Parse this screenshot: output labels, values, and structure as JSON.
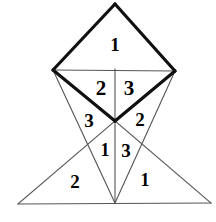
{
  "figure": {
    "canvas": {
      "width": 216,
      "height": 222
    },
    "colors": {
      "background": "#ffffff",
      "stroke_heavy": "#101010",
      "stroke_light": "#555555",
      "label": "#000000"
    },
    "stroke_widths": {
      "heavy": 3.2,
      "light": 1.1
    },
    "vertices": {
      "top_apex": {
        "x": 115,
        "y": 4
      },
      "left_vertex": {
        "x": 53,
        "y": 70
      },
      "right_vertex": {
        "x": 175,
        "y": 71
      },
      "center": {
        "x": 115,
        "y": 121
      },
      "bottom_apex": {
        "x": 115,
        "y": 203
      },
      "bottom_left": {
        "x": 18,
        "y": 204
      },
      "bottom_right": {
        "x": 211,
        "y": 203
      }
    },
    "edges": [
      {
        "name": "diamond-upper-left",
        "from": "top_apex",
        "to": "left_vertex",
        "weight": "heavy"
      },
      {
        "name": "diamond-upper-right",
        "from": "top_apex",
        "to": "right_vertex",
        "weight": "heavy"
      },
      {
        "name": "diamond-lower-left",
        "from": "left_vertex",
        "to": "center",
        "weight": "heavy"
      },
      {
        "name": "diamond-lower-right",
        "from": "right_vertex",
        "to": "center",
        "weight": "heavy"
      },
      {
        "name": "diamond-horizontal-diagonal",
        "from": "left_vertex",
        "to": "right_vertex",
        "weight": "light"
      },
      {
        "name": "vertical-axis",
        "from": "left_vertex_top",
        "to": "bottom_apex",
        "weight": "light"
      },
      {
        "name": "left-long-edge",
        "from": "left_vertex",
        "to": "bottom_apex",
        "weight": "light"
      },
      {
        "name": "right-long-edge",
        "from": "right_vertex",
        "to": "bottom_apex",
        "weight": "light"
      },
      {
        "name": "baseline",
        "from": "bottom_left",
        "to": "bottom_right",
        "weight": "light"
      },
      {
        "name": "left-base-edge",
        "from": "bottom_left",
        "to": "center",
        "weight": "light"
      },
      {
        "name": "right-base-edge",
        "from": "center",
        "to": "bottom_right",
        "weight": "light"
      }
    ],
    "labels": [
      {
        "name": "label-top-1",
        "text": "1",
        "x": 115,
        "y": 44,
        "size": 19
      },
      {
        "name": "label-upper-left-2",
        "text": "2",
        "x": 101,
        "y": 88,
        "size": 21
      },
      {
        "name": "label-upper-right-3",
        "text": "3",
        "x": 129,
        "y": 88,
        "size": 21
      },
      {
        "name": "label-mid-left-3",
        "text": "3",
        "x": 89,
        "y": 120,
        "size": 19
      },
      {
        "name": "label-mid-right-2",
        "text": "2",
        "x": 140,
        "y": 119,
        "size": 19
      },
      {
        "name": "label-lower-left-1",
        "text": "1",
        "x": 105,
        "y": 150,
        "size": 18
      },
      {
        "name": "label-lower-right-3",
        "text": "3",
        "x": 126,
        "y": 150,
        "size": 19
      },
      {
        "name": "label-bottom-left-2",
        "text": "2",
        "x": 75,
        "y": 181,
        "size": 19
      },
      {
        "name": "label-bottom-right-1",
        "text": "1",
        "x": 145,
        "y": 180,
        "size": 18
      }
    ]
  }
}
